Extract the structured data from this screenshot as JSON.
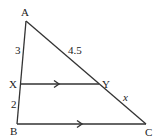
{
  "diagram": {
    "type": "triangle-parallel-line",
    "stroke_color": "#333333",
    "points": {
      "A": {
        "label": "A",
        "x": 26,
        "y": 21
      },
      "X": {
        "label": "X",
        "x": 20,
        "y": 84
      },
      "B": {
        "label": "B",
        "x": 17,
        "y": 124
      },
      "Y": {
        "label": "Y",
        "x": 99,
        "y": 84
      },
      "C": {
        "label": "C",
        "x": 146,
        "y": 124
      }
    },
    "segment_labels": {
      "AX": "3",
      "XB": "2",
      "AY": "4.5",
      "YC": "x"
    },
    "parallel_segments": [
      "XY",
      "BC"
    ]
  }
}
